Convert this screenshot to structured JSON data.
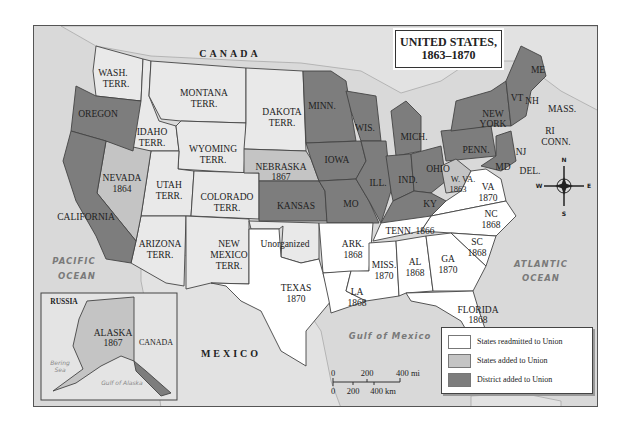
{
  "title": {
    "line1": "UNITED STATES,",
    "line2": "1863–1870"
  },
  "colors": {
    "readmitted": "#ffffff",
    "added": "#c4c4c4",
    "district": "#7d7d7d",
    "territory": "#e9e9e9",
    "water": "#d9d9d9"
  },
  "countries": {
    "canada": "CANADA",
    "mexico": "MEXICO",
    "russia": "RUSSIA",
    "canada_inset": "CANADA"
  },
  "water": {
    "pacific1": "PACIFIC",
    "pacific2": "OCEAN",
    "atlantic1": "ATLANTIC",
    "atlantic2": "OCEAN",
    "gulf": "Gulf of Mexico",
    "bering1": "Bering",
    "bering2": "Sea",
    "gulf_alaska": "Gulf of Alaska"
  },
  "regions": {
    "wash": [
      "WASH.",
      "TERR."
    ],
    "oregon": [
      "OREGON"
    ],
    "california": [
      "CALIFORNIA"
    ],
    "idaho": [
      "IDAHO",
      "TERR."
    ],
    "nevada": [
      "NEVADA",
      "1864"
    ],
    "montana": [
      "MONTANA",
      "TERR."
    ],
    "wyoming": [
      "WYOMING",
      "TERR."
    ],
    "utah": [
      "UTAH",
      "TERR."
    ],
    "colorado": [
      "COLORADO",
      "TERR."
    ],
    "arizona": [
      "ARIZONA",
      "TERR."
    ],
    "newmexico": [
      "NEW",
      "MEXICO",
      "TERR."
    ],
    "dakota": [
      "DAKOTA",
      "TERR."
    ],
    "nebraska": [
      "NEBRASKA",
      "1867"
    ],
    "kansas": [
      "KANSAS"
    ],
    "unorganized": [
      "Unorganized"
    ],
    "texas": [
      "TEXAS",
      "1870"
    ],
    "minn": [
      "MINN."
    ],
    "iowa": [
      "IOWA"
    ],
    "mo": [
      "MO"
    ],
    "wis": [
      "WIS."
    ],
    "ill": [
      "ILL."
    ],
    "mich": [
      "MICH."
    ],
    "ind": [
      "IND."
    ],
    "ohio": [
      "OHIO"
    ],
    "ky": [
      "KY"
    ],
    "wva": [
      "W. VA.",
      "1863"
    ],
    "va": [
      "VA",
      "1870"
    ],
    "nc": [
      "NC",
      "1868"
    ],
    "tenn": [
      "TENN. 1866"
    ],
    "ark": [
      "ARK.",
      "1868"
    ],
    "la": [
      "LA",
      "1868"
    ],
    "miss": [
      "MISS.",
      "1870"
    ],
    "al": [
      "AL",
      "1868"
    ],
    "ga": [
      "GA",
      "1870"
    ],
    "sc": [
      "SC",
      "1868"
    ],
    "florida": [
      "FLORIDA",
      "1868"
    ],
    "penn": [
      "PENN."
    ],
    "newyork": [
      "NEW",
      "YORK"
    ],
    "nj": [
      "NJ"
    ],
    "md": [
      "MD"
    ],
    "del": [
      "DEL."
    ],
    "me": [
      "ME"
    ],
    "vt": [
      "VT"
    ],
    "nh": [
      "NH"
    ],
    "mass": [
      "MASS."
    ],
    "ri": [
      "RI"
    ],
    "conn": [
      "CONN."
    ],
    "alaska": [
      "ALASKA",
      "1867"
    ]
  },
  "compass": {
    "n": "N",
    "s": "S",
    "e": "E",
    "w": "W"
  },
  "scale": {
    "mi_ticks": [
      "0",
      "200",
      "400 mi"
    ],
    "km_ticks": [
      "0",
      "200",
      "400 km"
    ]
  },
  "legend": {
    "items": [
      {
        "label": "States readmitted to Union",
        "category": "readmitted"
      },
      {
        "label": "States added to Union",
        "category": "added"
      },
      {
        "label": "District added to Union",
        "category": "district"
      }
    ]
  }
}
